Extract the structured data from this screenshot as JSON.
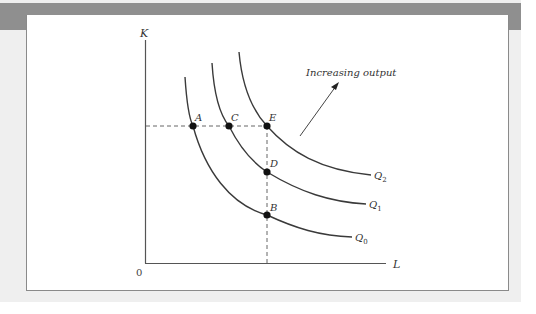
{
  "figure": {
    "y_axis_label": "K",
    "x_axis_label": "L",
    "origin_label": "0",
    "annotation": "Increasing output",
    "curves": [
      {
        "id": "q0",
        "label": "Q",
        "subscript": "0"
      },
      {
        "id": "q1",
        "label": "Q",
        "subscript": "1"
      },
      {
        "id": "q2",
        "label": "Q",
        "subscript": "2"
      }
    ],
    "points": [
      {
        "id": "A",
        "label": "A"
      },
      {
        "id": "C",
        "label": "C"
      },
      {
        "id": "E",
        "label": "E"
      },
      {
        "id": "D",
        "label": "D"
      },
      {
        "id": "B",
        "label": "B"
      }
    ]
  },
  "colors": {
    "band": "#8f8f8f",
    "background": "#efefef",
    "panel": "#ffffff",
    "curve": "#3a3a3a"
  }
}
